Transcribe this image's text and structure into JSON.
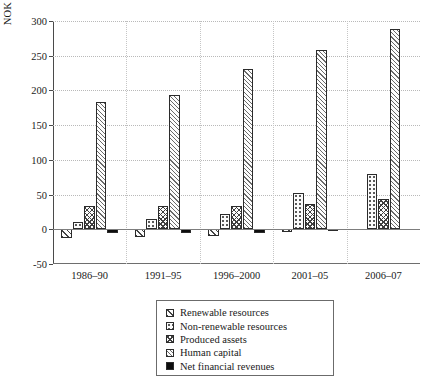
{
  "chart_data": {
    "type": "bar",
    "title": "",
    "xlabel": "",
    "ylabel": "NOK 1000 per capita (constant 2007 prices)",
    "categories": [
      "1986–90",
      "1991–95",
      "1996–2000",
      "2001–05",
      "2006–07"
    ],
    "ylim": [
      -50,
      300
    ],
    "yticks": [
      -50,
      0,
      50,
      100,
      150,
      200,
      250,
      300
    ],
    "ytick_labels": [
      "-50",
      "0",
      "50",
      "100",
      "150",
      "200",
      "250",
      "300"
    ],
    "grid": true,
    "legend_position": "below-plot",
    "series": [
      {
        "name": "Renewable resources",
        "key": "renew",
        "pattern": "diagonal-hatch",
        "values": [
          -13,
          -11,
          -9,
          -4,
          0
        ]
      },
      {
        "name": "Non-renewable resources",
        "key": "nonrenew",
        "pattern": "dotted",
        "values": [
          11,
          15,
          22,
          52,
          80
        ]
      },
      {
        "name": "Produced assets",
        "key": "produced",
        "pattern": "crosshatch",
        "values": [
          33,
          33,
          33,
          36,
          44
        ]
      },
      {
        "name": "Human capital",
        "key": "human",
        "pattern": "fine-diagonal",
        "values": [
          184,
          193,
          231,
          258,
          288
        ]
      },
      {
        "name": "Net financial revenues",
        "key": "netfin",
        "pattern": "solid-black",
        "values": [
          -5,
          -6,
          -5,
          -2,
          0
        ]
      }
    ]
  },
  "legend": {
    "items": [
      {
        "label": "Renewable resources"
      },
      {
        "label": "Non-renewable resources"
      },
      {
        "label": "Produced assets"
      },
      {
        "label": "Human capital"
      },
      {
        "label": "Net financial revenues"
      }
    ]
  }
}
